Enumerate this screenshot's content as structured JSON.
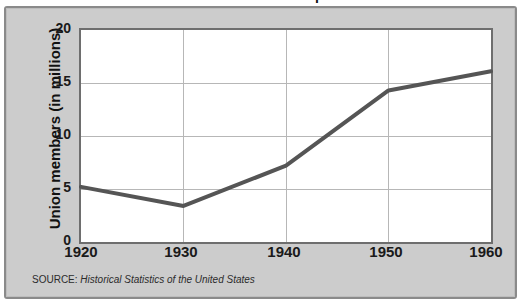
{
  "figure": {
    "cropped_title": "Union Membership",
    "background_color": "#cccccc",
    "panel_border_color": "#8a8a8a",
    "plot_background_color": "#ffffff",
    "plot_border_color": "#6e6e6e",
    "gridline_color": "#b7b7b7",
    "line_color": "#555555"
  },
  "source_note": {
    "label": "SOURCE:",
    "title": "Historical Statistics of the United States"
  },
  "axes": {
    "y_label": "Union members (in millions)",
    "y_ticks": [
      "0",
      "5",
      "10",
      "15",
      "20"
    ],
    "x_ticks": [
      "1920",
      "1930",
      "1940",
      "1950",
      "1960"
    ]
  },
  "chart_data": {
    "type": "line",
    "title": "Union Membership",
    "xlabel": "",
    "ylabel": "Union members (in millions)",
    "x": [
      1920,
      1930,
      1940,
      1950,
      1960
    ],
    "values": [
      5.2,
      3.4,
      7.2,
      14.3,
      16.1
    ],
    "series": [
      {
        "name": "Union members",
        "values": [
          5.2,
          3.4,
          7.2,
          14.3,
          16.1
        ],
        "color": "#555555",
        "line_width_px": 4
      }
    ],
    "xlim": [
      1920,
      1960
    ],
    "ylim": [
      0,
      20
    ],
    "x_ticks": [
      1920,
      1930,
      1940,
      1950,
      1960
    ],
    "y_ticks": [
      0,
      5,
      10,
      15,
      20
    ],
    "grid": true,
    "legend": "none",
    "annotations": [
      "SOURCE: Historical Statistics of the United States"
    ]
  }
}
